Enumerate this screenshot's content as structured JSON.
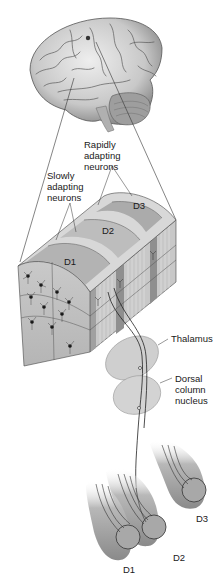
{
  "figure": {
    "labels": {
      "rapidly_adapting": "Rapidly\nadapting\nneurons",
      "rapidly_line1": "Rapidly",
      "rapidly_line2": "adapting",
      "rapidly_line3": "neurons",
      "slowly_line1": "Slowly",
      "slowly_line2": "adapting",
      "slowly_line3": "neurons",
      "thalamus": "Thalamus",
      "dorsal_line1": "Dorsal",
      "dorsal_line2": "column",
      "dorsal_line3": "nucleus"
    },
    "cortex_strips": [
      {
        "label": "D1"
      },
      {
        "label": "D2"
      },
      {
        "label": "D3"
      }
    ],
    "fingers": [
      {
        "label": "D1"
      },
      {
        "label": "D2"
      },
      {
        "label": "D3"
      }
    ]
  },
  "colors": {
    "strip_dark": "#a9a9a9",
    "strip_light": "#d9d9d9",
    "nucleus": "#cfcfcf",
    "finger": "#9a9a9a",
    "line": "#222222"
  }
}
